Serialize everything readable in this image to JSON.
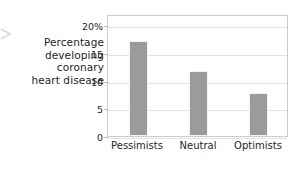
{
  "chart_data": {
    "type": "bar",
    "title": "",
    "subtitle": "",
    "xlabel": "",
    "ylabel": "Percentage developing coronary heart disease",
    "ylabel_lines": [
      "Percentage",
      "developing",
      "coronary",
      "heart disease"
    ],
    "categories": [
      "Pessimists",
      "Neutral",
      "Optimists"
    ],
    "values": [
      17.2,
      11.7,
      7.8
    ],
    "ylim": [
      0,
      22
    ],
    "yticks": [
      0,
      5,
      10,
      15,
      20
    ],
    "ytick_labels": [
      "0",
      "5",
      "10",
      "15",
      "20%"
    ],
    "grid": true,
    "legend": "none",
    "bar_color": "#9b9b9b",
    "grid_color": "#dfe2e4",
    "frame_color": "#c9cccf",
    "text_color": "#231f20",
    "background": "#ffffff"
  }
}
